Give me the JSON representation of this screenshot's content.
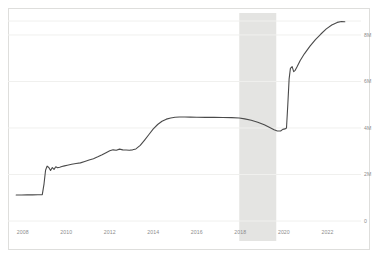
{
  "chart_data": {
    "type": "line",
    "title": "",
    "subtitle": "",
    "xlabel": "",
    "ylabel": "",
    "grid": true,
    "legend": false,
    "xlim": [
      2007.6,
      2022.9
    ],
    "ylim": [
      0,
      8600000
    ],
    "x_tick_labels": [
      "2008",
      "2010",
      "2012",
      "2014",
      "2016",
      "2018",
      "2020",
      "2022"
    ],
    "x_ticks": [
      2008,
      2010,
      2012,
      2014,
      2016,
      2018,
      2020,
      2022
    ],
    "y_tick_labels": [
      "0",
      "2M",
      "4M",
      "6M",
      "8M"
    ],
    "y_ticks": [
      0,
      2000000,
      4000000,
      6000000,
      8000000
    ],
    "line_color": "#4a4a4a",
    "grid_color": "#f0f0ee",
    "border_color": "#dededc",
    "shaded_regions": [
      {
        "name": "recession-band",
        "x_start": 2017.95,
        "x_end": 2019.65,
        "color": "#e4e4e2"
      }
    ],
    "series": [
      {
        "name": "series-1",
        "color": "#4a4a4a",
        "x": [
          2007.7,
          2007.95,
          2008.2,
          2008.45,
          2008.7,
          2008.9,
          2008.98,
          2009.05,
          2009.12,
          2009.2,
          2009.28,
          2009.36,
          2009.44,
          2009.52,
          2009.6,
          2009.7,
          2009.8,
          2009.92,
          2010.05,
          2010.25,
          2010.45,
          2010.65,
          2010.85,
          2011.05,
          2011.25,
          2011.45,
          2011.65,
          2011.85,
          2012.0,
          2012.15,
          2012.3,
          2012.45,
          2012.6,
          2012.75,
          2012.9,
          2013.05,
          2013.2,
          2013.4,
          2013.6,
          2013.8,
          2014.0,
          2014.2,
          2014.4,
          2014.6,
          2014.8,
          2015.0,
          2015.2,
          2015.45,
          2015.7,
          2016.0,
          2016.4,
          2016.8,
          2017.2,
          2017.6,
          2017.95,
          2018.2,
          2018.5,
          2018.8,
          2019.1,
          2019.35,
          2019.55,
          2019.7,
          2019.85,
          2019.95,
          2020.05,
          2020.12,
          2020.18,
          2020.24,
          2020.3,
          2020.38,
          2020.45,
          2020.52,
          2020.6,
          2020.75,
          2020.95,
          2021.2,
          2021.45,
          2021.7,
          2021.95,
          2022.2,
          2022.45,
          2022.65,
          2022.8
        ],
        "y": [
          1120000,
          1120000,
          1125000,
          1125000,
          1130000,
          1135000,
          1600000,
          2180000,
          2360000,
          2300000,
          2170000,
          2300000,
          2220000,
          2330000,
          2290000,
          2310000,
          2340000,
          2370000,
          2400000,
          2440000,
          2470000,
          2500000,
          2560000,
          2620000,
          2680000,
          2760000,
          2850000,
          2950000,
          3020000,
          3060000,
          3040000,
          3090000,
          3060000,
          3050000,
          3040000,
          3060000,
          3100000,
          3250000,
          3480000,
          3720000,
          3960000,
          4150000,
          4290000,
          4380000,
          4430000,
          4460000,
          4470000,
          4470000,
          4465000,
          4460000,
          4455000,
          4455000,
          4450000,
          4445000,
          4430000,
          4390000,
          4330000,
          4250000,
          4140000,
          4020000,
          3920000,
          3870000,
          3870000,
          3940000,
          3960000,
          4000000,
          5000000,
          6100000,
          6560000,
          6640000,
          6420000,
          6480000,
          6620000,
          6900000,
          7200000,
          7520000,
          7800000,
          8040000,
          8260000,
          8430000,
          8540000,
          8580000,
          8570000
        ]
      }
    ]
  },
  "axes": {
    "x_labels": [
      "2008",
      "2010",
      "2012",
      "2014",
      "2016",
      "2018",
      "2020",
      "2022"
    ],
    "y_labels": [
      "8M",
      "6M",
      "4M",
      "2M",
      "0"
    ]
  }
}
